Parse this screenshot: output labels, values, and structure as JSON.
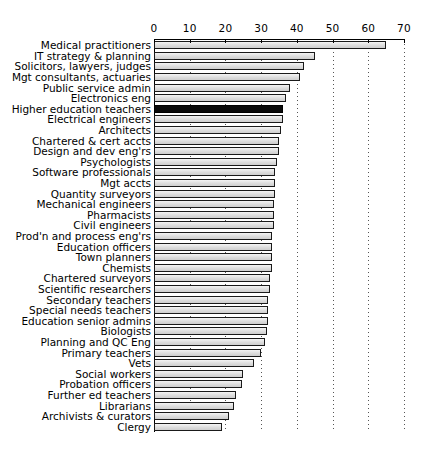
{
  "chart_data": {
    "type": "bar",
    "orientation": "horizontal",
    "title": "",
    "subtitle": "",
    "xlabel": "",
    "ylabel": "",
    "xlim": [
      0,
      70
    ],
    "ylim": null,
    "grid": true,
    "grid_axis": "x",
    "grid_style": "dotted",
    "legend": null,
    "legend_position": "none",
    "xticks": [
      0,
      10,
      20,
      30,
      40,
      50,
      60,
      70
    ],
    "xtick_labels": [
      "0",
      "10",
      "20",
      "30",
      "40",
      "50",
      "60",
      "70"
    ],
    "highlight_category": "Higher education teachers",
    "highlight_color": "#0a0a0a",
    "bar_color": "#e0e0e0",
    "bar_edge_color": "#1a1a1a",
    "categories": [
      "Medical practitioners",
      "IT strategy & planning",
      "Solicitors, lawyers, judges",
      "Mgt consultants, actuaries",
      "Public service admin",
      "Electronics eng",
      "Higher education teachers",
      "Electrical engineers",
      "Architects",
      "Chartered & cert accts",
      "Design and dev eng'rs",
      "Psychologists",
      "Software professionals",
      "Mgt accts",
      "Quantity surveyors",
      "Mechanical engineers",
      "Pharmacists",
      "Civil engineers",
      "Prod'n and process eng'rs",
      "Education officers",
      "Town planners",
      "Chemists",
      "Chartered surveyors",
      "Scientific researchers",
      "Secondary teachers",
      "Special needs teachers",
      "Education senior admins",
      "Biologists",
      "Planning and QC Eng",
      "Primary teachers",
      "Vets",
      "Social workers",
      "Probation officers",
      "Further ed teachers",
      "Librarians",
      "Archivists & curators",
      "Clergy"
    ],
    "values": [
      65,
      45,
      42,
      41,
      38,
      37,
      36,
      36,
      35.5,
      35,
      35,
      34.5,
      34,
      34,
      34,
      33.5,
      33.5,
      33.5,
      33,
      33,
      33,
      33,
      32.5,
      32.5,
      32,
      32,
      32,
      31.5,
      31,
      30,
      28,
      25,
      24.5,
      23,
      22.5,
      21,
      19
    ]
  }
}
